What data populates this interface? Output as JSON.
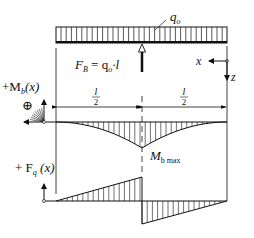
{
  "diagram": {
    "type": "beam-load-diagram",
    "load": {
      "label_main": "q",
      "label_sub": "o",
      "description": "uniformly distributed load over full beam length"
    },
    "support": {
      "label_F": "F",
      "label_F_sub": "B",
      "label_eq": " = q",
      "label_eq_sub": "o",
      "label_tail": "·l",
      "position": "midspan"
    },
    "axes": {
      "x_label": "x",
      "z_label": "z"
    },
    "dimensions": {
      "left_num": "l",
      "left_den": "2",
      "right_num": "l",
      "right_den": "2"
    },
    "moment_diagram": {
      "title_prefix": "+M",
      "title_sub": "b",
      "title_suffix": "(x)",
      "sign_symbol": "⊕",
      "max_label_main": "M",
      "max_label_sub": "b max",
      "shape": "two parabolic curves meeting at negative peak at midspan"
    },
    "shear_diagram": {
      "title_prefix": "+ F",
      "title_sub": "q",
      "title_suffix": " (x)",
      "shape": "linear rising to jump at midspan, linear back to zero"
    },
    "colors": {
      "line": "#111111",
      "background": "#ffffff"
    }
  }
}
